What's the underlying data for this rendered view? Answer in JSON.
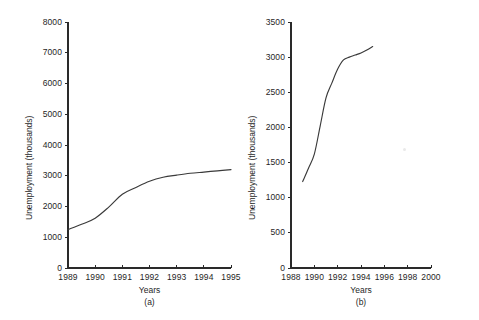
{
  "figure": {
    "background": "#ffffff",
    "line_color": "#3a3a3a",
    "axis_color": "#2a2a2a"
  },
  "chart_data": [
    {
      "type": "line",
      "panel": "a",
      "caption": "(a)",
      "title": "",
      "xlabel": "Years",
      "ylabel": "Unemployment (thousands)",
      "xlim": [
        1989,
        1995
      ],
      "ylim": [
        0,
        8000
      ],
      "grid": false,
      "legend": null,
      "xticks": [
        1989,
        1990,
        1991,
        1992,
        1993,
        1994,
        1995
      ],
      "xtick_labels": [
        "1989",
        "1990",
        "1991",
        "1992",
        "1993",
        "1994",
        "1995"
      ],
      "yticks": [
        0,
        1000,
        2000,
        3000,
        4000,
        5000,
        6000,
        7000,
        8000
      ],
      "ytick_labels": [
        "0",
        "1000",
        "2000",
        "3000",
        "4000",
        "5000",
        "6000",
        "7000",
        "8000"
      ],
      "x": [
        1989,
        1989.5,
        1990,
        1990.5,
        1991,
        1991.5,
        1992,
        1992.5,
        1993,
        1993.5,
        1994,
        1994.5,
        1995
      ],
      "values": [
        1250,
        1420,
        1620,
        1980,
        2400,
        2620,
        2820,
        2950,
        3020,
        3080,
        3120,
        3160,
        3200
      ],
      "series": [
        {
          "name": "Unemployment",
          "values": [
            1250,
            1420,
            1620,
            1980,
            2400,
            2620,
            2820,
            2950,
            3020,
            3080,
            3120,
            3160,
            3200
          ]
        }
      ]
    },
    {
      "type": "line",
      "panel": "b",
      "caption": "(b)",
      "title": "",
      "xlabel": "Years",
      "ylabel": "Unemployment (thousands)",
      "xlim": [
        1988,
        2000
      ],
      "ylim": [
        0,
        3500
      ],
      "grid": false,
      "legend": null,
      "xticks": [
        1988,
        1990,
        1992,
        1994,
        1996,
        1998,
        2000
      ],
      "xtick_labels": [
        "1988",
        "1990",
        "1992",
        "1994",
        "1996",
        "1998",
        "2000"
      ],
      "yticks": [
        0,
        500,
        1000,
        1500,
        2000,
        2500,
        3000,
        3500
      ],
      "ytick_labels": [
        "0",
        "500",
        "1000",
        "1500",
        "2000",
        "2500",
        "3000",
        "3500"
      ],
      "x": [
        1989,
        1989.5,
        1990,
        1990.5,
        1991,
        1991.5,
        1992,
        1992.5,
        1993,
        1993.5,
        1994,
        1994.5,
        1995
      ],
      "values": [
        1230,
        1420,
        1620,
        2020,
        2420,
        2630,
        2830,
        2960,
        3000,
        3030,
        3060,
        3100,
        3150
      ],
      "series": [
        {
          "name": "Unemployment",
          "values": [
            1230,
            1420,
            1620,
            2020,
            2420,
            2630,
            2830,
            2960,
            3000,
            3030,
            3060,
            3100,
            3150
          ]
        }
      ]
    }
  ]
}
